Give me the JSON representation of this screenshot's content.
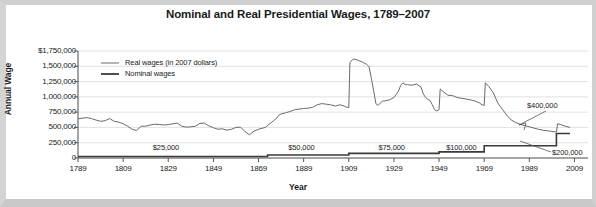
{
  "figure": {
    "title": "Nominal and Real Presidential Wages, 1789–2007",
    "background_color": "#ffffff",
    "frame_color": "#cfcfcf"
  },
  "chart_data": {
    "type": "line",
    "title": "Nominal and Real Presidential Wages, 1789–2007",
    "xlabel": "Year",
    "ylabel": "Annual Wage",
    "xlim": [
      1789,
      2015
    ],
    "ylim": [
      0,
      1750000
    ],
    "grid": true,
    "grid_axis": "y",
    "legend_position": "top-left-inside",
    "x_ticks": [
      1789,
      1809,
      1829,
      1849,
      1869,
      1889,
      1909,
      1929,
      1949,
      1969,
      1989,
      2009
    ],
    "x_tick_labels": [
      "1789",
      "1809",
      "1829",
      "1849",
      "1869",
      "1889",
      "1909",
      "1929",
      "1949",
      "1969",
      "1989",
      "2009"
    ],
    "y_ticks": [
      0,
      250000,
      500000,
      750000,
      1000000,
      1250000,
      1500000,
      1750000
    ],
    "y_tick_labels": [
      "0",
      "250,000",
      "500,000",
      "750,000",
      "1,000,000",
      "1,250,000",
      "1,500,000",
      "1,750,000"
    ],
    "y_tick_label_top": "$1,750,000",
    "series": [
      {
        "name": "Real wages (in 2007 dollars)",
        "color": "#6b6b6b",
        "line_width": 1.0,
        "points": [
          [
            1789,
            640000
          ],
          [
            1791,
            652000
          ],
          [
            1793,
            660000
          ],
          [
            1795,
            645000
          ],
          [
            1797,
            620000
          ],
          [
            1799,
            600000
          ],
          [
            1801,
            610000
          ],
          [
            1803,
            645000
          ],
          [
            1805,
            600000
          ],
          [
            1807,
            588000
          ],
          [
            1809,
            560000
          ],
          [
            1811,
            520000
          ],
          [
            1813,
            470000
          ],
          [
            1815,
            450000
          ],
          [
            1817,
            520000
          ],
          [
            1819,
            520000
          ],
          [
            1821,
            540000
          ],
          [
            1823,
            552000
          ],
          [
            1825,
            548000
          ],
          [
            1827,
            540000
          ],
          [
            1829,
            545000
          ],
          [
            1831,
            560000
          ],
          [
            1833,
            570000
          ],
          [
            1835,
            520000
          ],
          [
            1837,
            505000
          ],
          [
            1839,
            510000
          ],
          [
            1841,
            520000
          ],
          [
            1843,
            565000
          ],
          [
            1845,
            570000
          ],
          [
            1847,
            525000
          ],
          [
            1849,
            495000
          ],
          [
            1851,
            470000
          ],
          [
            1853,
            478000
          ],
          [
            1855,
            455000
          ],
          [
            1857,
            470000
          ],
          [
            1859,
            500000
          ],
          [
            1861,
            505000
          ],
          [
            1863,
            430000
          ],
          [
            1865,
            380000
          ],
          [
            1867,
            440000
          ],
          [
            1869,
            470000
          ],
          [
            1871,
            490000
          ],
          [
            1872,
            500000
          ],
          [
            1873,
            530000
          ],
          [
            1874,
            560000
          ],
          [
            1875,
            590000
          ],
          [
            1876,
            620000
          ],
          [
            1877,
            650000
          ],
          [
            1878,
            700000
          ],
          [
            1879,
            720000
          ],
          [
            1881,
            740000
          ],
          [
            1883,
            760000
          ],
          [
            1885,
            790000
          ],
          [
            1887,
            800000
          ],
          [
            1889,
            810000
          ],
          [
            1891,
            815000
          ],
          [
            1893,
            830000
          ],
          [
            1895,
            870000
          ],
          [
            1897,
            890000
          ],
          [
            1899,
            880000
          ],
          [
            1901,
            870000
          ],
          [
            1903,
            850000
          ],
          [
            1905,
            870000
          ],
          [
            1907,
            850000
          ],
          [
            1908,
            830000
          ],
          [
            1909,
            825000
          ],
          [
            1909.5,
            1560000
          ],
          [
            1911,
            1620000
          ],
          [
            1913,
            1600000
          ],
          [
            1915,
            1570000
          ],
          [
            1917,
            1530000
          ],
          [
            1918,
            1490000
          ],
          [
            1919,
            1300000
          ],
          [
            1920,
            1100000
          ],
          [
            1921,
            890000
          ],
          [
            1922,
            860000
          ],
          [
            1923,
            900000
          ],
          [
            1924,
            930000
          ],
          [
            1925,
            935000
          ],
          [
            1927,
            950000
          ],
          [
            1929,
            990000
          ],
          [
            1931,
            1090000
          ],
          [
            1932,
            1190000
          ],
          [
            1933,
            1230000
          ],
          [
            1934,
            1200000
          ],
          [
            1935,
            1200000
          ],
          [
            1937,
            1190000
          ],
          [
            1939,
            1210000
          ],
          [
            1941,
            1160000
          ],
          [
            1942,
            1050000
          ],
          [
            1943,
            990000
          ],
          [
            1944,
            960000
          ],
          [
            1945,
            940000
          ],
          [
            1946,
            870000
          ],
          [
            1947,
            790000
          ],
          [
            1948,
            770000
          ],
          [
            1949,
            790000
          ],
          [
            1949.5,
            1130000
          ],
          [
            1951,
            1080000
          ],
          [
            1953,
            1025000
          ],
          [
            1955,
            1020000
          ],
          [
            1957,
            990000
          ],
          [
            1959,
            975000
          ],
          [
            1961,
            965000
          ],
          [
            1963,
            950000
          ],
          [
            1965,
            930000
          ],
          [
            1967,
            900000
          ],
          [
            1968,
            870000
          ],
          [
            1969,
            860000
          ],
          [
            1969.5,
            1230000
          ],
          [
            1971,
            1170000
          ],
          [
            1973,
            1070000
          ],
          [
            1975,
            900000
          ],
          [
            1977,
            800000
          ],
          [
            1979,
            700000
          ],
          [
            1981,
            620000
          ],
          [
            1983,
            580000
          ],
          [
            1985,
            550000
          ],
          [
            1987,
            530000
          ],
          [
            1989,
            510000
          ],
          [
            1991,
            490000
          ],
          [
            1993,
            470000
          ],
          [
            1995,
            455000
          ],
          [
            1997,
            445000
          ],
          [
            1999,
            435000
          ],
          [
            2000,
            430000
          ],
          [
            2001,
            425000
          ],
          [
            2001.5,
            560000
          ],
          [
            2003,
            545000
          ],
          [
            2005,
            520000
          ],
          [
            2007,
            500000
          ]
        ]
      },
      {
        "name": "Nominal wages",
        "color": "#3a3a3a",
        "line_width": 1.6,
        "step": true,
        "points": [
          [
            1789,
            25000
          ],
          [
            1873,
            25000
          ],
          [
            1873,
            50000
          ],
          [
            1909,
            50000
          ],
          [
            1909,
            75000
          ],
          [
            1949,
            75000
          ],
          [
            1949,
            100000
          ],
          [
            1969,
            100000
          ],
          [
            1969,
            200000
          ],
          [
            2001,
            200000
          ],
          [
            2001,
            400000
          ],
          [
            2007,
            400000
          ]
        ]
      }
    ],
    "annotations": [
      {
        "text": "$25,000",
        "x": 1831,
        "y": 160000,
        "kind": "step-label"
      },
      {
        "text": "$50,000",
        "x": 1891,
        "y": 160000,
        "kind": "step-label"
      },
      {
        "text": "$75,000",
        "x": 1931,
        "y": 160000,
        "kind": "step-label"
      },
      {
        "text": "$100,000",
        "x": 1961,
        "y": 160000,
        "kind": "step-label"
      },
      {
        "text": "$200,000",
        "x": 2009,
        "y": 130000,
        "kind": "leader-label"
      },
      {
        "text": "$400,000",
        "x": 2000,
        "y": 640000,
        "kind": "leader-label"
      }
    ]
  },
  "legend": {
    "items": [
      {
        "label": "Real wages (in 2007 dollars)",
        "color": "#6b6b6b"
      },
      {
        "label": "Nominal wages",
        "color": "#3a3a3a"
      }
    ]
  }
}
